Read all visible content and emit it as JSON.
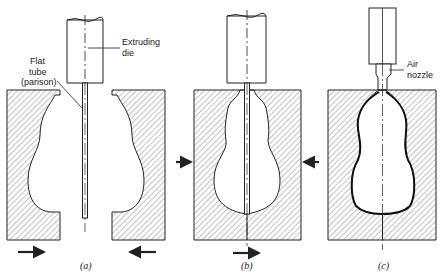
{
  "diagram": {
    "panels": [
      {
        "id": "a",
        "caption": "(a)",
        "labels": {
          "die_line1": "Extruding",
          "die_line2": "die",
          "tube_line1": "Flat",
          "tube_line2": "tube",
          "tube_line3": "(parison)"
        },
        "state": "mould open, parison extruded between halves; halves moving inward"
      },
      {
        "id": "b",
        "caption": "(b)",
        "state": "mould closed around parison, sealed at bottom"
      },
      {
        "id": "c",
        "caption": "(c)",
        "labels": {
          "nozzle_line1": "Air",
          "nozzle_line2": "nozzle"
        },
        "state": "air blown through nozzle expands parison to mould cavity"
      }
    ],
    "colors": {
      "ink": "#222222",
      "hatch": "#555555",
      "background": "#ffffff"
    }
  }
}
